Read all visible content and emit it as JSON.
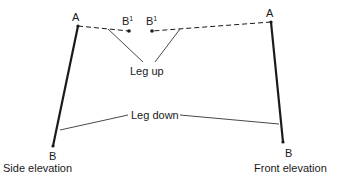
{
  "diagram": {
    "type": "leg elevation diagram",
    "colors": {
      "line": "#1a1a1a",
      "background": "#ffffff"
    },
    "side_elevation": {
      "caption": "Side elevation",
      "point_a": {
        "label": "A",
        "x": 78,
        "y": 26
      },
      "point_b": {
        "label": "B",
        "x": 53,
        "y": 146
      },
      "point_b1": {
        "label": "B",
        "superscript": "1",
        "x": 129,
        "y": 31
      }
    },
    "front_elevation": {
      "caption": "Front elevation",
      "point_a": {
        "label": "A",
        "x": 271,
        "y": 22
      },
      "point_b": {
        "label": "B",
        "x": 283,
        "y": 142
      },
      "point_b1": {
        "label": "B",
        "superscript": "1",
        "x": 152,
        "y": 31
      }
    },
    "annotations": {
      "leg_up": "Leg up",
      "leg_down": "Leg down"
    },
    "legend": {
      "solid_line": "Leg down",
      "dashed_line": "Leg up"
    }
  }
}
